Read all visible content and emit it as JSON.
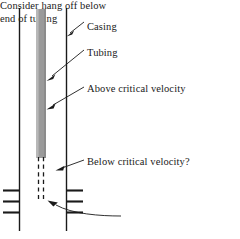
{
  "figure": {
    "type": "wellbore-schematic",
    "colors": {
      "line": "#1a1a1a",
      "tubing_fill": "#9a9a9a",
      "tubing_fill_light": "#b5b5b5",
      "text": "#1a1a1a",
      "background": "#ffffff"
    },
    "annotations": [
      {
        "id": "casing",
        "text": "Casing"
      },
      {
        "id": "tubing",
        "text": "Tubing"
      },
      {
        "id": "above",
        "text": "Above critical velocity"
      },
      {
        "id": "below",
        "text": "Below critical velocity?"
      },
      {
        "id": "hangoff_line1",
        "text": "Consider hang off below"
      },
      {
        "id": "hangoff_line2",
        "text": "end of tubing"
      }
    ],
    "elements": {
      "left_casing_label": "left-casing-wall",
      "right_casing_label": "right-casing-wall",
      "tubing_label": "tubing-column",
      "tubing_dashed_label": "tubing-dashed-extension",
      "perforations_left_label": "perforations-left",
      "perforations_right_label": "perforations-right"
    }
  }
}
